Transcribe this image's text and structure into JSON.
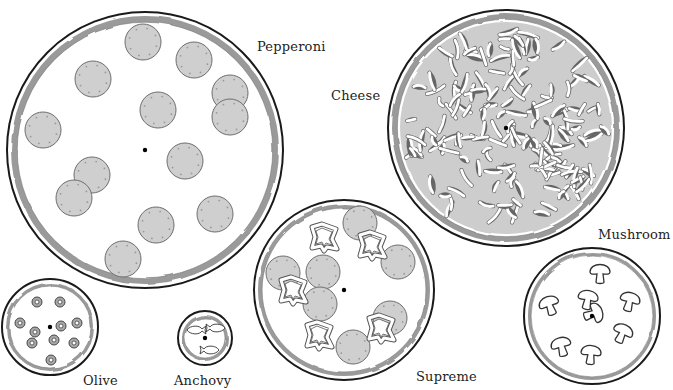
{
  "colors": {
    "outline": "#1a1a1a",
    "sauce": "#9a9a9a",
    "pepperoni_fill": "#cfcfcf",
    "pepperoni_stroke": "#6e6e6e",
    "cheese_fill": "#cdcdcd",
    "background": "#ffffff"
  },
  "pizzas": [
    {
      "name": "Pepperoni",
      "label_pos": [
        257,
        52
      ],
      "center": [
        145,
        150
      ],
      "radius": 138,
      "topping": "pepperoni",
      "toppings": [
        [
          143,
          42
        ],
        [
          194,
          60
        ],
        [
          93,
          79
        ],
        [
          158,
          110
        ],
        [
          230,
          93
        ],
        [
          230,
          117
        ],
        [
          43,
          130
        ],
        [
          185,
          161
        ],
        [
          92,
          175
        ],
        [
          74,
          198
        ],
        [
          215,
          214
        ],
        [
          156,
          225
        ],
        [
          123,
          259
        ]
      ],
      "topping_radius": 18
    },
    {
      "name": "Cheese",
      "label_pos": [
        331,
        101
      ],
      "center": [
        506,
        128
      ],
      "radius": 118,
      "topping": "cheese"
    },
    {
      "name": "Supreme",
      "label_pos": [
        416,
        382
      ],
      "center": [
        344,
        290
      ],
      "radius": 90,
      "topping": "supreme",
      "toppings": [
        [
          360,
          223
        ],
        [
          398,
          262
        ],
        [
          283,
          273
        ],
        [
          323,
          272
        ],
        [
          320,
          304
        ],
        [
          390,
          318
        ],
        [
          353,
          347
        ]
      ],
      "topping_radius": 17,
      "peppers": [
        [
          324,
          237
        ],
        [
          372,
          245
        ],
        [
          293,
          290
        ],
        [
          319,
          335
        ],
        [
          381,
          328
        ]
      ]
    },
    {
      "name": "Mushroom",
      "label_pos": [
        598,
        240
      ],
      "center": [
        592,
        316
      ],
      "radius": 68,
      "topping": "mushroom",
      "toppings": [
        [
          600,
          272
        ],
        [
          549,
          304
        ],
        [
          588,
          298
        ],
        [
          630,
          300
        ],
        [
          595,
          313
        ],
        [
          623,
          332
        ],
        [
          561,
          345
        ],
        [
          591,
          353
        ]
      ]
    },
    {
      "name": "Olive",
      "label_pos": [
        83,
        386
      ],
      "center": [
        50,
        327
      ],
      "radius": 48,
      "topping": "olive",
      "toppings": [
        [
          37,
          302
        ],
        [
          60,
          302
        ],
        [
          20,
          323
        ],
        [
          35,
          332
        ],
        [
          61,
          326
        ],
        [
          77,
          323
        ],
        [
          32,
          343
        ],
        [
          54,
          340
        ],
        [
          74,
          343
        ],
        [
          51,
          360
        ]
      ]
    },
    {
      "name": "Anchovy",
      "label_pos": [
        174,
        386
      ],
      "center": [
        205,
        338
      ],
      "radius": 27,
      "topping": "anchovy",
      "toppings": [
        [
          196,
          330
        ],
        [
          216,
          328
        ],
        [
          210,
          350
        ]
      ]
    }
  ]
}
